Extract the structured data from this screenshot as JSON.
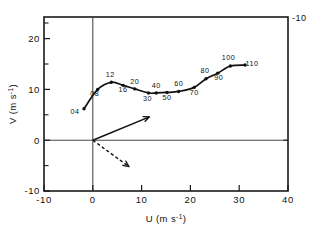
{
  "figure": {
    "background_color": "#ffffff",
    "ink_color": "#111111",
    "corner_label": "-10"
  },
  "chart_data": {
    "type": "line",
    "title": "",
    "subtitle": "",
    "xlabel": "U (m s",
    "xlabel_sup": "-1",
    "xlabel_tail": ")",
    "ylabel": "V (m s",
    "ylabel_sup": "-1",
    "ylabel_tail": ")",
    "xlim": [
      -10,
      40
    ],
    "ylim": [
      -10,
      25
    ],
    "xticks": [
      -10,
      0,
      10,
      20,
      30,
      40
    ],
    "xtick_labels": [
      "-10",
      "0",
      "10",
      "20",
      "30",
      "40"
    ],
    "yticks": [
      -10,
      0,
      10,
      20
    ],
    "ytick_labels": [
      "-10",
      "0",
      "10",
      "20"
    ],
    "x_minor_ticks": [
      -5,
      5,
      15,
      25,
      35
    ],
    "y_minor_ticks": [
      -5,
      5,
      15,
      25
    ],
    "grid": false,
    "legend": "none",
    "series": [
      {
        "name": "hodograph",
        "point_labels": [
          "04",
          "08",
          "12",
          "16",
          "20",
          "30",
          "40",
          "50",
          "60",
          "70",
          "80",
          "90",
          "100",
          "110"
        ],
        "x": [
          -1.8,
          1.0,
          3.8,
          6.2,
          8.6,
          11.4,
          13.0,
          15.2,
          17.6,
          20.8,
          23.2,
          25.6,
          28.2,
          31.2
        ],
        "y": [
          6.2,
          10.0,
          11.4,
          10.8,
          10.1,
          9.3,
          9.3,
          9.4,
          9.6,
          10.4,
          12.1,
          13.2,
          14.6,
          14.8
        ],
        "label_offsets": [
          [
            -9,
            5
          ],
          [
            -3,
            7
          ],
          [
            -1,
            -5
          ],
          [
            0,
            7
          ],
          [
            0,
            -5
          ],
          [
            -1,
            8
          ],
          [
            0,
            -5
          ],
          [
            0,
            8
          ],
          [
            0,
            -5
          ],
          [
            0,
            8
          ],
          [
            -1,
            -6
          ],
          [
            1,
            7
          ],
          [
            -2,
            -6
          ],
          [
            7,
            1
          ]
        ]
      }
    ],
    "annotations": [
      {
        "name": "mean-wind-vector",
        "style": "solid-arrow",
        "from": [
          0,
          0
        ],
        "to": [
          11.6,
          4.6
        ]
      },
      {
        "name": "secondary-vector",
        "style": "dashed-arrow",
        "from": [
          0,
          0
        ],
        "to": [
          7.4,
          -5.2
        ]
      }
    ]
  }
}
